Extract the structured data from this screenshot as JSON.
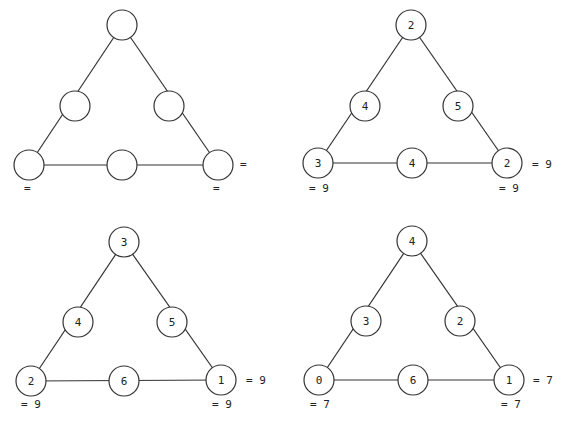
{
  "puzzles": [
    {
      "name": "blank",
      "nodes": {
        "top": "",
        "mid_left": "",
        "mid_right": "",
        "bottom_left": "",
        "bottom_mid": "",
        "bottom_right": ""
      },
      "sums": {
        "left": "=",
        "right": "=",
        "bottom": "="
      }
    },
    {
      "name": "sum-9-a",
      "nodes": {
        "top": "2",
        "mid_left": "4",
        "mid_right": "5",
        "bottom_left": "3",
        "bottom_mid": "4",
        "bottom_right": "2"
      },
      "sums": {
        "left": "= 9",
        "right": "= 9",
        "bottom": "= 9"
      }
    },
    {
      "name": "sum-9-b",
      "nodes": {
        "top": "3",
        "mid_left": "4",
        "mid_right": "5",
        "bottom_left": "2",
        "bottom_mid": "6",
        "bottom_right": "1"
      },
      "sums": {
        "left": "= 9",
        "right": "= 9",
        "bottom": "= 9"
      }
    },
    {
      "name": "sum-7",
      "nodes": {
        "top": "4",
        "mid_left": "3",
        "mid_right": "2",
        "bottom_left": "0",
        "bottom_mid": "6",
        "bottom_right": "1"
      },
      "sums": {
        "left": "= 7",
        "right": "= 7",
        "bottom": "= 7"
      }
    }
  ]
}
